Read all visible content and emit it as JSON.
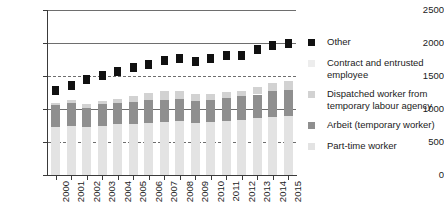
{
  "chart_data": {
    "type": "bar",
    "title": "",
    "subtitle": "",
    "xlabel": "",
    "ylabel": "",
    "stacked": true,
    "grid": true,
    "legend_position": "right",
    "ylim": [
      0,
      2500
    ],
    "yticks": [
      0,
      500,
      1000,
      1500,
      2000,
      2500
    ],
    "ytick_labels": [
      "0",
      "500",
      "1000",
      "1500",
      "2000",
      "2500"
    ],
    "categories": [
      "2000",
      "2001",
      "2002",
      "2003",
      "2004",
      "2005",
      "2006",
      "2007",
      "2008",
      "2009",
      "2010",
      "2011",
      "2012",
      "2013",
      "2014",
      "2015"
    ],
    "series": [
      {
        "name": "Part-time worker",
        "type": "bar",
        "color": "#e3e3e3",
        "values": [
          720,
          740,
          720,
          750,
          770,
          780,
          790,
          800,
          820,
          790,
          800,
          820,
          840,
          860,
          880,
          890
        ]
      },
      {
        "name": "Arbeit (temporary worker)",
        "type": "bar",
        "color": "#8f8f8f",
        "values": [
          340,
          350,
          300,
          320,
          320,
          330,
          340,
          340,
          330,
          330,
          330,
          340,
          350,
          360,
          390,
          400
        ]
      },
      {
        "name": "Dispatched worker from temporary labour agency",
        "type": "bar",
        "color": "#d2d2d2",
        "values": [
          30,
          45,
          50,
          50,
          60,
          90,
          120,
          130,
          130,
          110,
          100,
          95,
          90,
          110,
          120,
          130
        ]
      },
      {
        "name": "Contract and entrusted employee",
        "type": "bar",
        "color": "#ededed",
        "values": [
          0,
          0,
          0,
          0,
          0,
          0,
          0,
          0,
          0,
          0,
          0,
          0,
          0,
          0,
          0,
          0
        ]
      },
      {
        "name": "Other",
        "type": "scatter",
        "color": "#111111",
        "values": [
          1273,
          1360,
          1451,
          1504,
          1564,
          1633,
          1678,
          1735,
          1765,
          1727,
          1763,
          1812,
          1816,
          1906,
          1962,
          1986
        ]
      }
    ],
    "legend_entries": [
      {
        "label": "Other",
        "color": "#111111",
        "lines": [
          "Other"
        ]
      },
      {
        "label": "Contract and entrusted employee",
        "color": "#ededed",
        "lines": [
          "Contract and entrusted",
          "employee"
        ]
      },
      {
        "label": "Dispatched worker from temporary labour agency",
        "color": "#d2d2d2",
        "lines": [
          "Dispatched worker from",
          "temporary labour agency"
        ]
      },
      {
        "label": "Arbeit (temporary worker)",
        "color": "#8f8f8f",
        "lines": [
          "Arbeit (temporary worker)"
        ]
      },
      {
        "label": "Part-time worker",
        "color": "#e3e3e3",
        "lines": [
          "Part-time worker"
        ]
      }
    ]
  }
}
